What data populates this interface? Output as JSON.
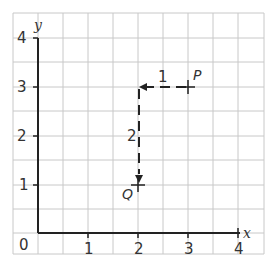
{
  "diagram": {
    "axes": {
      "x_label": "x",
      "y_label": "y",
      "origin_label": "0",
      "x_ticks": [
        "1",
        "2",
        "3",
        "4"
      ],
      "y_ticks": [
        "1",
        "2",
        "3",
        "4"
      ]
    },
    "points": [
      {
        "name": "P",
        "x": 3,
        "y": 3
      },
      {
        "name": "Q",
        "x": 2,
        "y": 1
      }
    ],
    "moves": [
      {
        "label": "1",
        "from": [
          3,
          3
        ],
        "to": [
          2,
          3
        ],
        "direction": "left"
      },
      {
        "label": "2",
        "from": [
          2,
          3
        ],
        "to": [
          2,
          1
        ],
        "direction": "down"
      }
    ],
    "colors": {
      "grid": "#c8c8c8",
      "axis": "#222222",
      "text": "#333333"
    }
  }
}
